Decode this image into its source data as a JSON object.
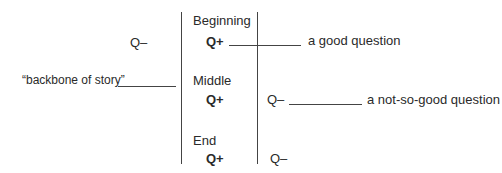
{
  "diagram": {
    "left_labels": {
      "q_minus": "Q–",
      "backbone": "“backbone of story”"
    },
    "sections": [
      {
        "label": "Beginning",
        "q_plus": "Q+"
      },
      {
        "label": "Middle",
        "q_plus": "Q+"
      },
      {
        "label": "End",
        "q_plus": "Q+"
      }
    ],
    "right_labels": {
      "good_question": "a good question",
      "middle_q_minus": "Q–",
      "not_so_good_question": "a not-so-good question",
      "end_q_minus": "Q–"
    }
  }
}
